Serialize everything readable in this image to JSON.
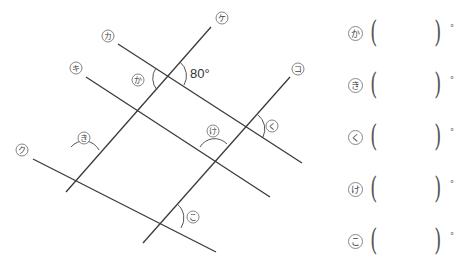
{
  "figure": {
    "lines": [
      {
        "id": "ka_line",
        "label": "カ",
        "x1": 118,
        "y1": 44,
        "x2": 302,
        "y2": 163,
        "lx": 108,
        "ly": 36
      },
      {
        "id": "ki_line",
        "label": "キ",
        "x1": 86,
        "y1": 77,
        "x2": 270,
        "y2": 197,
        "lx": 76,
        "ly": 68
      },
      {
        "id": "ku_line",
        "label": "ク",
        "x1": 33,
        "y1": 159,
        "x2": 216,
        "y2": 252,
        "lx": 22,
        "ly": 150
      },
      {
        "id": "ke_line",
        "label": "ケ",
        "x1": 211,
        "y1": 27,
        "x2": 66,
        "y2": 192,
        "lx": 222,
        "ly": 18
      },
      {
        "id": "ko_line",
        "label": "コ",
        "x1": 290,
        "y1": 77,
        "x2": 143,
        "y2": 243,
        "lx": 298,
        "ly": 69
      }
    ],
    "given_angle": {
      "text": "80°",
      "x": 190,
      "y": 78
    },
    "angle_marks": [
      {
        "id": "ka",
        "label": "か",
        "lx": 138,
        "ly": 80
      },
      {
        "id": "ki",
        "label": "き",
        "lx": 84,
        "ly": 138
      },
      {
        "id": "ku",
        "label": "く",
        "lx": 272,
        "ly": 126
      },
      {
        "id": "ke",
        "label": "け",
        "lx": 213,
        "ly": 131
      },
      {
        "id": "ko",
        "label": "こ",
        "lx": 193,
        "ly": 217
      }
    ]
  },
  "answers": [
    {
      "label": "か",
      "unit": "°"
    },
    {
      "label": "き",
      "unit": "°"
    },
    {
      "label": "く",
      "unit": "°"
    },
    {
      "label": "け",
      "unit": "°"
    },
    {
      "label": "こ",
      "unit": "°"
    }
  ],
  "paren_open": "(",
  "paren_close": ")"
}
